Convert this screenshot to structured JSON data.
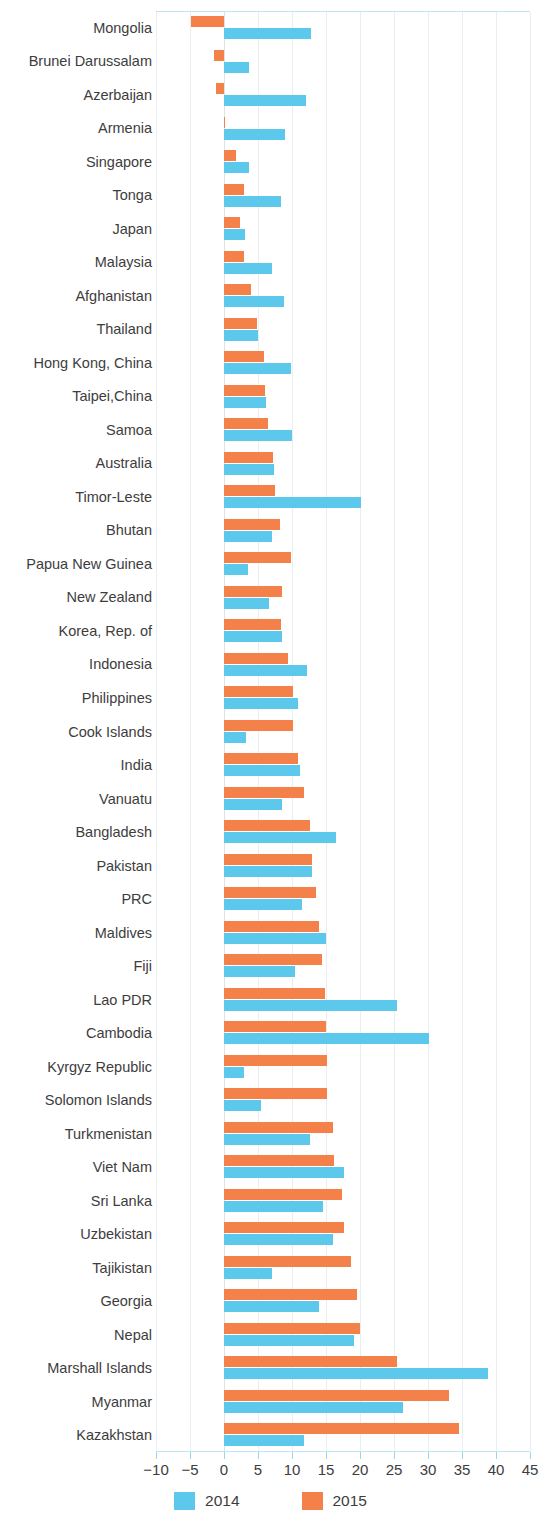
{
  "chart_data": {
    "type": "bar",
    "orientation": "horizontal",
    "title": "",
    "subtitle": "",
    "xlabel": "",
    "ylabel": "",
    "xlim": [
      -10,
      45
    ],
    "xticks": [
      -10,
      -5,
      0,
      5,
      10,
      15,
      20,
      25,
      30,
      35,
      40,
      45
    ],
    "xtick_labels": [
      "-10",
      "-5",
      "0",
      "5",
      "10",
      "15",
      "20",
      "25",
      "30",
      "35",
      "40",
      "45"
    ],
    "grid": true,
    "legend_position": "bottom",
    "colors": {
      "2014": "#5BC8EC",
      "2015": "#F4814A"
    },
    "categories": [
      "Mongolia",
      "Brunei Darussalam",
      "Azerbaijan",
      "Armenia",
      "Singapore",
      "Tonga",
      "Japan",
      "Malaysia",
      "Afghanistan",
      "Thailand",
      "Hong Kong, China",
      "Taipei,China",
      "Samoa",
      "Australia",
      "Timor-Leste",
      "Bhutan",
      "Papua New Guinea",
      "New Zealand",
      "Korea, Rep. of",
      "Indonesia",
      "Philippines",
      "Cook Islands",
      "India",
      "Vanuatu",
      "Bangladesh",
      "Pakistan",
      "PRC",
      "Maldives",
      "Fiji",
      "Lao PDR",
      "Cambodia",
      "Kyrgyz Republic",
      "Solomon Islands",
      "Turkmenistan",
      "Viet Nam",
      "Sri Lanka",
      "Uzbekistan",
      "Tajikistan",
      "Georgia",
      "Nepal",
      "Marshall Islands",
      "Myanmar",
      "Kazakhstan"
    ],
    "series": [
      {
        "name": "2014",
        "color": "#5BC8EC",
        "values": [
          12.8,
          3.7,
          12.0,
          9.0,
          3.7,
          8.4,
          3.1,
          7.1,
          8.8,
          5.0,
          9.8,
          6.2,
          10.0,
          7.4,
          20.2,
          7.0,
          3.6,
          6.6,
          8.5,
          12.2,
          10.9,
          3.2,
          11.2,
          8.6,
          16.5,
          13.0,
          11.5,
          15.0,
          10.4,
          25.5,
          30.2,
          3.0,
          5.5,
          12.6,
          17.6,
          14.5,
          16.1,
          7.1,
          13.9,
          19.1,
          38.8,
          26.3,
          11.7
        ]
      },
      {
        "name": "2015",
        "color": "#F4814A",
        "values": [
          -4.9,
          -1.4,
          -1.2,
          0.0,
          1.8,
          2.9,
          2.3,
          3.0,
          4.0,
          4.9,
          5.9,
          6.1,
          6.4,
          7.2,
          7.5,
          8.2,
          9.8,
          8.5,
          8.4,
          9.4,
          10.1,
          10.1,
          10.9,
          11.7,
          12.7,
          12.9,
          13.5,
          13.9,
          14.4,
          14.9,
          15.0,
          15.2,
          15.2,
          16.0,
          16.2,
          17.4,
          17.6,
          18.7,
          19.6,
          20.0,
          25.5,
          33.1,
          34.5
        ]
      }
    ]
  },
  "legend": {
    "items": [
      {
        "label": "2014",
        "color": "#5BC8EC"
      },
      {
        "label": "2015",
        "color": "#F4814A"
      }
    ]
  }
}
